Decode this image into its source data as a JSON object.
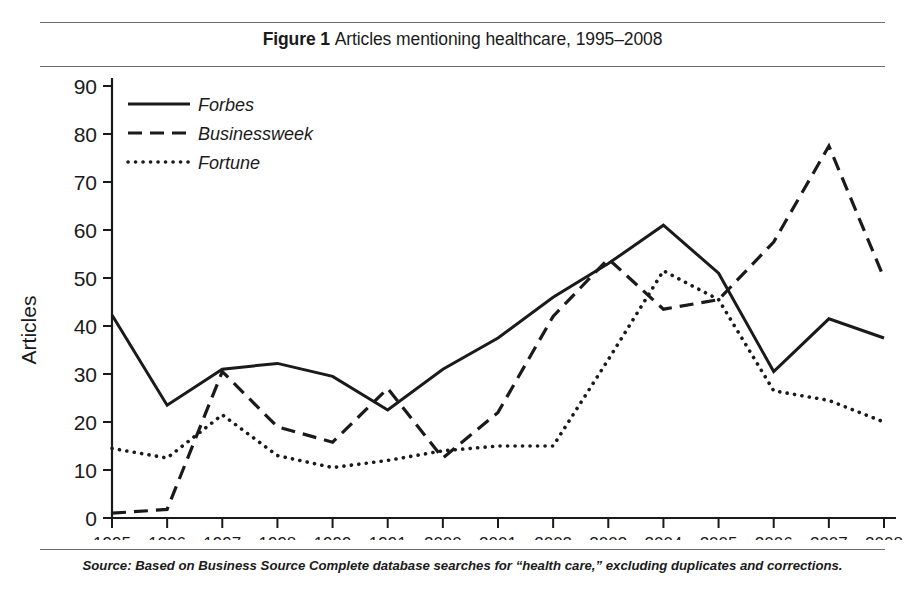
{
  "title": {
    "figure_label": "Figure 1",
    "caption": "Articles mentioning healthcare, 1995–2008"
  },
  "source_note": "Source: Based on Business Source Complete database searches for “health care,” excluding duplicates and corrections.",
  "chart_data": {
    "type": "line",
    "xlabel": "",
    "ylabel": "Articles",
    "ylim": [
      0,
      90
    ],
    "yticks": [
      0,
      10,
      20,
      30,
      40,
      50,
      60,
      70,
      80,
      90
    ],
    "grid": false,
    "legend_position": "top-left",
    "categories": [
      "1995",
      "1996",
      "1997",
      "1998",
      "1999",
      "1991",
      "2000",
      "2001",
      "2002",
      "2003",
      "2004",
      "2005",
      "2006",
      "2007",
      "2008"
    ],
    "x_tick_labels": [
      "1995",
      "1996",
      "1997",
      "1998",
      "1999",
      "1991",
      "2000",
      "2001",
      "2002",
      "2003",
      "2004",
      "2005",
      "2006",
      "2007",
      "2008"
    ],
    "series": [
      {
        "name": "Forbes",
        "style": "solid",
        "color": "#1a1a1a",
        "values": [
          42.3,
          23.5,
          31.0,
          32.2,
          29.5,
          22.5,
          31.0,
          37.5,
          46.0,
          53.0,
          61.0,
          51.0,
          30.5,
          41.5,
          37.5
        ]
      },
      {
        "name": "Businessweek",
        "style": "dashed",
        "color": "#1a1a1a",
        "values": [
          1.0,
          1.8,
          30.5,
          19.0,
          15.8,
          27.0,
          12.5,
          22.0,
          42.0,
          54.0,
          43.5,
          45.5,
          57.5,
          77.5,
          50.0
        ]
      },
      {
        "name": "Fortune",
        "style": "dotted",
        "color": "#1a1a1a",
        "values": [
          14.5,
          12.5,
          21.5,
          13.0,
          10.5,
          12.0,
          14.0,
          15.0,
          15.0,
          33.0,
          51.5,
          45.5,
          33.0,
          26.5,
          24.5
        ]
      }
    ],
    "series_end_note": {
      "fortune_2008": 20.0
    },
    "fortune_values_actual": [
      14.5,
      12.5,
      21.5,
      13.0,
      10.5,
      12.0,
      14.0,
      15.0,
      15.0,
      33.0,
      51.5,
      45.5,
      26.5,
      24.5,
      20.0
    ],
    "businessweek_values_actual": [
      1.0,
      1.8,
      30.5,
      19.0,
      15.8,
      27.0,
      12.5,
      22.0,
      42.0,
      54.0,
      43.5,
      45.5,
      57.5,
      77.5,
      50.0
    ],
    "forbes_values_actual": [
      42.3,
      23.5,
      31.0,
      32.2,
      29.5,
      22.5,
      31.0,
      37.5,
      46.0,
      53.0,
      61.0,
      51.0,
      30.5,
      41.5,
      37.5
    ]
  },
  "legend": {
    "items": [
      {
        "label": "Forbes",
        "style": "solid"
      },
      {
        "label": "Businessweek",
        "style": "dashed"
      },
      {
        "label": "Fortune",
        "style": "dotted"
      }
    ]
  }
}
